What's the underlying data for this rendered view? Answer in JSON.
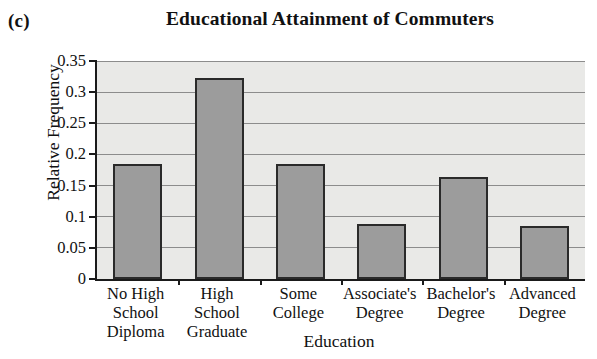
{
  "panel": {
    "marker": "(c)"
  },
  "chart_data": {
    "type": "bar",
    "title": "Educational Attainment of Commuters",
    "xlabel": "Education",
    "ylabel": "Relative Frequency",
    "categories": [
      "No High School Diploma",
      "High School Graduate",
      "Some College",
      "Associate's Degree",
      "Bachelor's Degree",
      "Advanced Degree"
    ],
    "category_lines": [
      [
        "No High",
        "School",
        "Diploma"
      ],
      [
        "High School",
        "Graduate"
      ],
      [
        "Some",
        "College"
      ],
      [
        "Associate's",
        "Degree"
      ],
      [
        "Bachelor's",
        "Degree"
      ],
      [
        "Advanced",
        "Degree"
      ]
    ],
    "values": [
      0.185,
      0.322,
      0.184,
      0.089,
      0.164,
      0.085
    ],
    "ylim": [
      0,
      0.35
    ],
    "yticks": [
      0,
      0.05,
      0.1,
      0.15,
      0.2,
      0.25,
      0.3,
      0.35
    ],
    "ytick_labels": [
      "0",
      "0.05",
      "0.1",
      "0.15",
      "0.2",
      "0.25",
      "0.3",
      "0.35"
    ],
    "grid": true,
    "legend": false,
    "colors": {
      "bar_fill": "#9c9c9c",
      "bar_edge": "#2a2a2a",
      "plot_background": "#e9e9e7",
      "gridline": "#8c8c8c",
      "axis": "#1a1a1a",
      "text": "#111111"
    }
  }
}
